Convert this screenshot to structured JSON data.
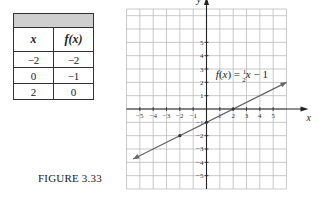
{
  "table": {
    "headers": [
      "x",
      "f(x)"
    ],
    "rows": [
      [
        "−2",
        "−2"
      ],
      [
        "0",
        "−1"
      ],
      [
        "2",
        "0"
      ]
    ]
  },
  "caption": "FIGURE 3.33",
  "chart_data": {
    "type": "line",
    "title": "",
    "equation_label": "f(x) = ½x − 1",
    "xlabel": "x",
    "ylabel": "y",
    "xlim": [
      -6,
      6
    ],
    "ylim": [
      -6,
      6
    ],
    "grid": true,
    "x_tick_labels": [
      "−5",
      "−4",
      "−3",
      "−2",
      "−1",
      "1",
      "2",
      "3",
      "4",
      "5"
    ],
    "y_tick_labels": [
      "5",
      "4",
      "3",
      "2",
      "1",
      "−1",
      "−2",
      "−3",
      "−4",
      "−5"
    ],
    "series": [
      {
        "name": "f(x) = 1/2 x - 1",
        "slope": 0.5,
        "intercept": -1,
        "x_range": [
          -5.5,
          6
        ],
        "arrows": "both",
        "highlighted_points": [
          [
            -2,
            -2
          ],
          [
            0,
            -1
          ],
          [
            2,
            0
          ]
        ]
      }
    ],
    "colors": {
      "line": "#666666",
      "grid": "#bbbbbb",
      "axis": "#222222"
    }
  }
}
